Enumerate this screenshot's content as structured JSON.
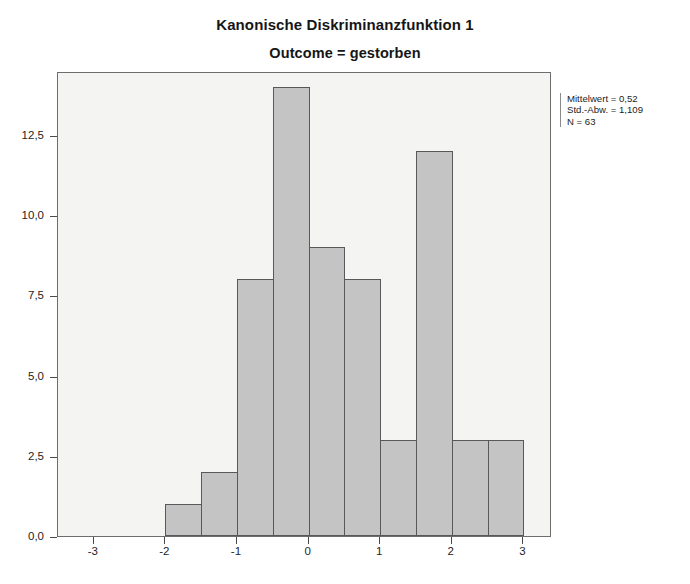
{
  "chart_data": {
    "type": "bar",
    "title": "Kanonische Diskriminanzfunktion 1",
    "subtitle": "Outcome = gestorben",
    "xlabel": "",
    "ylabel": "",
    "bin_width": 0.5,
    "grid": false,
    "legend": null,
    "xlim": [
      -3.5,
      3.4
    ],
    "ylim": [
      0,
      14.5
    ],
    "xticks": [
      -3,
      -2,
      -1,
      0,
      1,
      2,
      3
    ],
    "xtick_labels": [
      "-3",
      "-2",
      "-1",
      "0",
      "1",
      "2",
      "3"
    ],
    "yticks": [
      0,
      2.5,
      5,
      7.5,
      10,
      12.5
    ],
    "ytick_labels": [
      "0,0",
      "2,5",
      "5,0",
      "7,5",
      "10,0",
      "12,5"
    ],
    "bin_left_edges": [
      -2.0,
      -1.5,
      -1.0,
      -0.5,
      0.0,
      0.5,
      1.0,
      1.5,
      2.0,
      2.5
    ],
    "values": [
      1,
      2,
      8,
      14,
      9,
      8,
      3,
      12,
      3,
      3
    ],
    "bar_fill": "#c4c4c4",
    "bar_edge": "#58585a",
    "plot_background": "#f4f4f3"
  },
  "stats": {
    "mean_label": "Mittelwert = 0,52",
    "sd_label": "Std.-Abw. = 1,109",
    "n_label": "N = 63"
  }
}
